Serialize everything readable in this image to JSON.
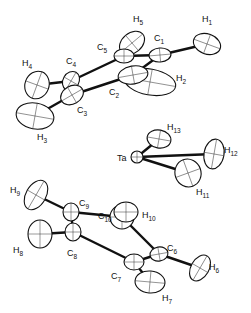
{
  "diagram": {
    "type": "ORTEP molecular structure",
    "atoms": [
      {
        "id": "H1",
        "label": "H",
        "sub": "1",
        "x": 207,
        "y": 44,
        "rx": 14,
        "ry": 10,
        "rot": 20,
        "lx": 202,
        "ly": 22
      },
      {
        "id": "C1",
        "label": "C",
        "sub": "1",
        "x": 160,
        "y": 55,
        "rx": 11,
        "ry": 7,
        "rot": -5,
        "lx": 154,
        "ly": 41
      },
      {
        "id": "H5",
        "label": "H",
        "sub": "5",
        "x": 132,
        "y": 43,
        "rx": 14,
        "ry": 10,
        "rot": -40,
        "lx": 133,
        "ly": 22
      },
      {
        "id": "C5",
        "label": "C",
        "sub": "5",
        "x": 124,
        "y": 56,
        "rx": 10,
        "ry": 7,
        "rot": 0,
        "lx": 97,
        "ly": 50
      },
      {
        "id": "H2",
        "label": "H",
        "sub": "2",
        "x": 150,
        "y": 82,
        "rx": 26,
        "ry": 13,
        "rot": 10,
        "lx": 176,
        "ly": 81
      },
      {
        "id": "C2",
        "label": "C",
        "sub": "2",
        "x": 133,
        "y": 75,
        "rx": 15,
        "ry": 9,
        "rot": -10,
        "lx": 109,
        "ly": 95
      },
      {
        "id": "C4",
        "label": "C",
        "sub": "4",
        "x": 71,
        "y": 81,
        "rx": 8,
        "ry": 10,
        "rot": 30,
        "lx": 66,
        "ly": 64
      },
      {
        "id": "H4",
        "label": "H",
        "sub": "4",
        "x": 37,
        "y": 85,
        "rx": 12,
        "ry": 14,
        "rot": 20,
        "lx": 22,
        "ly": 66
      },
      {
        "id": "C3",
        "label": "C",
        "sub": "3",
        "x": 72,
        "y": 95,
        "rx": 12,
        "ry": 9,
        "rot": -30,
        "lx": 77,
        "ly": 113
      },
      {
        "id": "H3",
        "label": "H",
        "sub": "3",
        "x": 35,
        "y": 116,
        "rx": 19,
        "ry": 13,
        "rot": 10,
        "lx": 37,
        "ly": 140
      },
      {
        "id": "H13",
        "label": "H",
        "sub": "13",
        "x": 159,
        "y": 139,
        "rx": 12,
        "ry": 9,
        "rot": 10,
        "lx": 167,
        "ly": 130
      },
      {
        "id": "Ta",
        "label": "Ta",
        "sub": "",
        "x": 137,
        "y": 157,
        "rx": 6,
        "ry": 6,
        "rot": 0,
        "lx": 117,
        "ly": 161
      },
      {
        "id": "H12",
        "label": "H",
        "sub": "12",
        "x": 214,
        "y": 154,
        "rx": 10,
        "ry": 15,
        "rot": 10,
        "lx": 224,
        "ly": 153
      },
      {
        "id": "H11",
        "label": "H",
        "sub": "11",
        "x": 188,
        "y": 173,
        "rx": 13,
        "ry": 14,
        "rot": -20,
        "lx": 196,
        "ly": 195
      },
      {
        "id": "H9",
        "label": "H",
        "sub": "9",
        "x": 36,
        "y": 195,
        "rx": 10,
        "ry": 16,
        "rot": 30,
        "lx": 10,
        "ly": 193
      },
      {
        "id": "C9",
        "label": "C",
        "sub": "9",
        "x": 71,
        "y": 212,
        "rx": 8,
        "ry": 9,
        "rot": 0,
        "lx": 79,
        "ly": 206
      },
      {
        "id": "C10",
        "label": "C",
        "sub": "10",
        "x": 122,
        "y": 217,
        "rx": 12,
        "ry": 12,
        "rot": 0,
        "lx": 98,
        "ly": 219
      },
      {
        "id": "H10",
        "label": "H",
        "sub": "10",
        "x": 126,
        "y": 212,
        "rx": 12,
        "ry": 10,
        "rot": 0,
        "lx": 142,
        "ly": 218
      },
      {
        "id": "H8",
        "label": "H",
        "sub": "8",
        "x": 40,
        "y": 234,
        "rx": 12,
        "ry": 14,
        "rot": 0,
        "lx": 13,
        "ly": 253
      },
      {
        "id": "C8",
        "label": "C",
        "sub": "8",
        "x": 73,
        "y": 232,
        "rx": 8,
        "ry": 9,
        "rot": 0,
        "lx": 67,
        "ly": 256
      },
      {
        "id": "C6",
        "label": "C",
        "sub": "6",
        "x": 159,
        "y": 254,
        "rx": 9,
        "ry": 7,
        "rot": -10,
        "lx": 167,
        "ly": 251
      },
      {
        "id": "C7",
        "label": "C",
        "sub": "7",
        "x": 134,
        "y": 262,
        "rx": 10,
        "ry": 8,
        "rot": 0,
        "lx": 111,
        "ly": 279
      },
      {
        "id": "H6",
        "label": "H",
        "sub": "6",
        "x": 200,
        "y": 268,
        "rx": 9,
        "ry": 14,
        "rot": 30,
        "lx": 209,
        "ly": 270
      },
      {
        "id": "H7",
        "label": "H",
        "sub": "7",
        "x": 150,
        "y": 282,
        "rx": 15,
        "ry": 11,
        "rot": 5,
        "lx": 162,
        "ly": 301
      }
    ],
    "bonds": [
      [
        "C1",
        "H1"
      ],
      [
        "C1",
        "C5"
      ],
      [
        "C5",
        "H5"
      ],
      [
        "C1",
        "C2"
      ],
      [
        "C5",
        "C4"
      ],
      [
        "C2",
        "C3"
      ],
      [
        "C4",
        "C3"
      ],
      [
        "C4",
        "H4"
      ],
      [
        "C3",
        "H3"
      ],
      [
        "Ta",
        "H13"
      ],
      [
        "Ta",
        "H12"
      ],
      [
        "Ta",
        "H11"
      ],
      [
        "C9",
        "H9"
      ],
      [
        "C9",
        "C10"
      ],
      [
        "C9",
        "C8"
      ],
      [
        "C8",
        "H8"
      ],
      [
        "C8",
        "C7"
      ],
      [
        "C10",
        "C6"
      ],
      [
        "C7",
        "C6"
      ],
      [
        "C6",
        "H6"
      ],
      [
        "C7",
        "H7"
      ]
    ]
  }
}
